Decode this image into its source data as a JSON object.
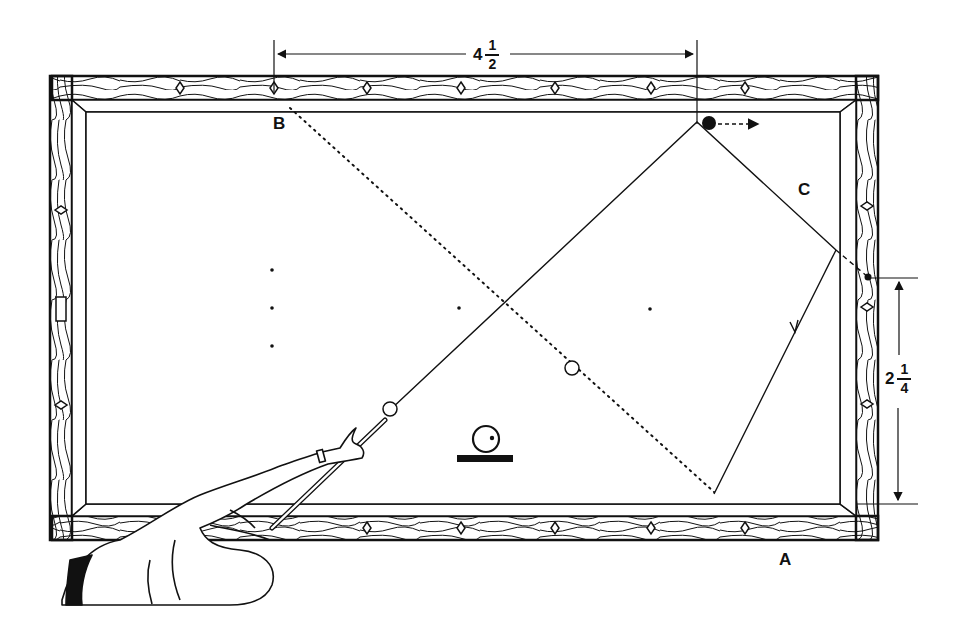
{
  "diagram": {
    "labels": {
      "point_a": "A",
      "point_b": "B",
      "point_c": "C"
    },
    "dimensions": {
      "top": {
        "whole": "4",
        "numerator": "1",
        "denominator": "2"
      },
      "right": {
        "whole": "2",
        "numerator": "1",
        "denominator": "4"
      }
    },
    "colors": {
      "ink": "#111111",
      "background": "#ffffff"
    },
    "elements": {
      "cue_ball": "white ball near cue tip",
      "object_ball": "black ball near top rail with dashed direction arrow",
      "ghost_ball": "white circle on dotted aim line",
      "english_indicator": "cue ball symbol with contact dot on base",
      "player": "player's arm and cue stick in lower left"
    }
  }
}
